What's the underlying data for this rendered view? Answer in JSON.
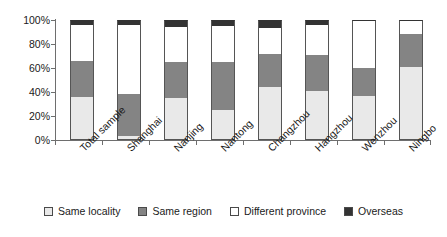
{
  "chart_data": {
    "type": "bar",
    "subtype": "stacked-percent",
    "title": "",
    "subtitle": "",
    "xlabel": "",
    "ylabel": "",
    "ylim": [
      0,
      100
    ],
    "ytick_labels": [
      "0%",
      "20%",
      "40%",
      "60%",
      "80%",
      "100%"
    ],
    "ytick_values": [
      0,
      20,
      40,
      60,
      80,
      100
    ],
    "grid": false,
    "legend_position": "bottom",
    "categories": [
      "Total sample",
      "Shanghai",
      "Nanjing",
      "Nantong",
      "Changzhou",
      "Hangzhou",
      "Wenzhou",
      "Ningbo"
    ],
    "series": [
      {
        "name": "Same locality",
        "color": "#e9e9e9",
        "values": [
          36,
          3,
          35,
          25,
          44,
          41,
          37,
          61
        ]
      },
      {
        "name": "Same region",
        "color": "#848484",
        "values": [
          30,
          35,
          30,
          40,
          28,
          30,
          23,
          27
        ]
      },
      {
        "name": "Different province",
        "color": "#ffffff",
        "values": [
          30,
          58,
          29,
          30,
          21,
          25,
          39,
          11
        ]
      },
      {
        "name": "Overseas",
        "color": "#333333",
        "values": [
          4,
          4,
          6,
          5,
          7,
          4,
          1,
          1
        ]
      }
    ]
  },
  "legend": {
    "items": [
      {
        "label": "Same locality",
        "color": "#e9e9e9"
      },
      {
        "label": "Same region",
        "color": "#848484"
      },
      {
        "label": "Different province",
        "color": "#ffffff"
      },
      {
        "label": "Overseas",
        "color": "#333333"
      }
    ]
  },
  "axis": {
    "y_labels": [
      "100%",
      "80%",
      "60%",
      "40%",
      "20%",
      "0%"
    ]
  }
}
